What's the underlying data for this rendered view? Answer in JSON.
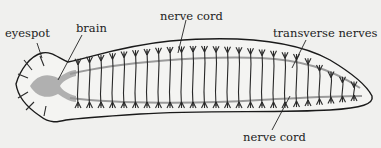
{
  "diagram": {
    "labels": {
      "eyespot": "eyespot",
      "brain": "brain",
      "nerve_cord_top": "nerve cord",
      "transverse_nerves": "transverse nerves",
      "nerve_cord_bottom": "nerve cord"
    },
    "colors": {
      "background": "#f0f0ee",
      "outline": "#1a1a1a",
      "nerve_cord": "#9a9a9a",
      "brain": "#a8a8a8",
      "nerves": "#2a2a2a",
      "text": "#222222"
    }
  }
}
